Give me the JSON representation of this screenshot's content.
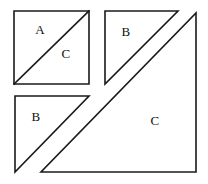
{
  "figure": {
    "background_color": "#ffffff",
    "stroke_color": "#1a1a1a",
    "fill_color": "#ffffff",
    "label_color": "#111111",
    "canvas": {
      "width": 208,
      "height": 184
    }
  },
  "shapes": {
    "square": {
      "name": "square-AC",
      "description": "square divided by a diagonal into triangle A and triangle C",
      "outline_points": "14,11 89,11 89,84 14,84",
      "divider_points": "14,84 89,11",
      "labels": [
        {
          "text": "A",
          "x": 40,
          "y": 31
        },
        {
          "text": "C",
          "x": 66,
          "y": 55
        }
      ]
    },
    "triangle_b_top": {
      "name": "triangle-B-top-right",
      "description": "right triangle labeled B, right angle at lower-left",
      "outline_points": "105,11 178,11 105,84",
      "label": {
        "text": "B",
        "x": 126,
        "y": 33
      }
    },
    "triangle_b_bottom": {
      "name": "triangle-B-bottom-left",
      "description": "right triangle labeled B, right angle at upper-left",
      "outline_points": "15,96 89,96 15,172",
      "label": {
        "text": "B",
        "x": 36,
        "y": 118
      }
    },
    "triangle_c_large": {
      "name": "triangle-C-large",
      "description": "large right triangle labeled C, right angle at lower-right",
      "outline_points": "196,13 196,172 41,172",
      "label": {
        "text": "C",
        "x": 155,
        "y": 122
      }
    }
  },
  "labels": {
    "A": "A",
    "B": "B",
    "C": "C"
  }
}
